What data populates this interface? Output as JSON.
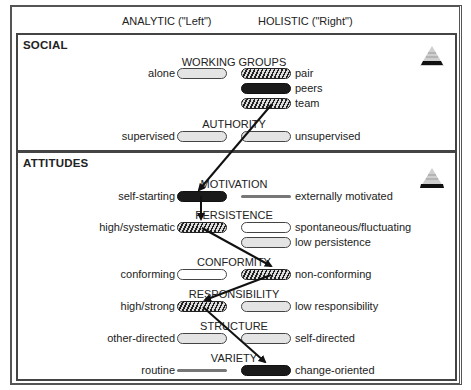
{
  "header": {
    "left_column": "ANALYTIC (\"Left\")",
    "right_column": "HOLISTIC (\"Right\")"
  },
  "sections": [
    {
      "title": "SOCIAL",
      "icon": "pyramid-icon",
      "categories": [
        {
          "name": "WORKING GROUPS",
          "left": [
            {
              "label": "alone",
              "style": "light"
            }
          ],
          "right": [
            {
              "label": "pair",
              "style": "hatched"
            },
            {
              "label": "peers",
              "style": "dark"
            },
            {
              "label": "team",
              "style": "hatched"
            }
          ]
        },
        {
          "name": "AUTHORITY",
          "left": [
            {
              "label": "supervised",
              "style": "light"
            }
          ],
          "right": [
            {
              "label": "unsupervised",
              "style": "light"
            }
          ]
        }
      ]
    },
    {
      "title": "ATTITUDES",
      "icon": "pyramid-icon",
      "categories": [
        {
          "name": "MOTIVATION",
          "left": [
            {
              "label": "self-starting",
              "style": "dark"
            }
          ],
          "right": [
            {
              "label": "externally motivated",
              "style": "line"
            }
          ]
        },
        {
          "name": "PERSISTENCE",
          "left": [
            {
              "label": "high/systematic",
              "style": "hatched"
            }
          ],
          "right": [
            {
              "label": "spontaneous/fluctuating",
              "style": "empty"
            },
            {
              "label": "low persistence",
              "style": "light"
            }
          ]
        },
        {
          "name": "CONFORMITY",
          "left": [
            {
              "label": "conforming",
              "style": "empty"
            }
          ],
          "right": [
            {
              "label": "non-conforming",
              "style": "hatched"
            }
          ]
        },
        {
          "name": "RESPONSIBILITY",
          "left": [
            {
              "label": "high/strong",
              "style": "hatched"
            }
          ],
          "right": [
            {
              "label": "low responsibility",
              "style": "light"
            }
          ]
        },
        {
          "name": "STRUCTURE",
          "left": [
            {
              "label": "other-directed",
              "style": "light"
            }
          ],
          "right": [
            {
              "label": "self-directed",
              "style": "light"
            }
          ]
        },
        {
          "name": "VARIETY",
          "left": [
            {
              "label": "routine",
              "style": "line"
            }
          ],
          "right": [
            {
              "label": "change-oriented",
              "style": "dark"
            }
          ]
        }
      ]
    }
  ],
  "profile_path": [
    "team",
    "self-starting",
    "high/systematic",
    "non-conforming",
    "high/strong",
    "change-oriented"
  ]
}
